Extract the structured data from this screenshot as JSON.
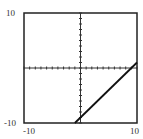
{
  "chart_data": {
    "type": "line",
    "title": "",
    "xlabel": "",
    "ylabel": "",
    "xlim": [
      -10,
      10
    ],
    "ylim": [
      -10,
      10
    ],
    "tick_step": 1,
    "grid": false,
    "tick_labels": {
      "x_min": "-10",
      "x_max": "10",
      "y_min": "-10",
      "y_max": "10"
    },
    "series": [
      {
        "name": "y = x - 9",
        "x": [
          -1,
          10
        ],
        "y": [
          -10,
          1
        ]
      }
    ]
  }
}
